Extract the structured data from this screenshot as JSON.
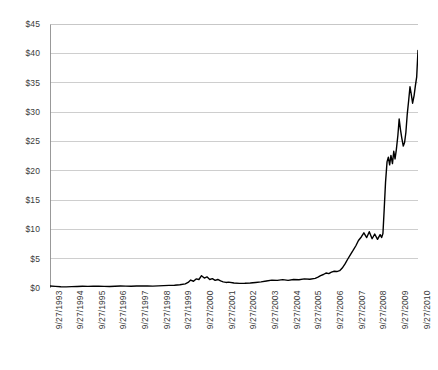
{
  "chart_data": {
    "type": "line",
    "title": "",
    "subtitle": "",
    "xlabel": "",
    "ylabel": "",
    "legend": [],
    "legend_position": "none",
    "grid": {
      "horizontal": true,
      "vertical": false,
      "color": "#b9b9b9"
    },
    "series_color": "#000000",
    "line_width": 1.4,
    "ylim": [
      0,
      45
    ],
    "ytick_step": 5,
    "ytick_labels": [
      "$0",
      "$5",
      "$10",
      "$15",
      "$20",
      "$25",
      "$30",
      "$35",
      "$40",
      "$45"
    ],
    "ytick_values": [
      0,
      5,
      10,
      15,
      20,
      25,
      30,
      35,
      40,
      45
    ],
    "xtick_labels": [
      "9/27/1993",
      "9/27/1994",
      "9/27/1995",
      "9/27/1996",
      "9/27/1997",
      "9/27/1998",
      "9/27/1999",
      "9/27/2000",
      "9/27/2001",
      "9/27/2002",
      "9/27/2003",
      "9/27/2004",
      "9/27/2005",
      "9/27/2006",
      "9/27/2007",
      "9/27/2008",
      "9/27/2009",
      "9/27/2010"
    ],
    "xlim": [
      1993.74,
      2010.74
    ],
    "series": [
      {
        "name": "price",
        "x": [
          1993.74,
          1993.99,
          1994.24,
          1994.49,
          1994.74,
          1994.99,
          1995.24,
          1995.49,
          1995.74,
          1995.99,
          1996.24,
          1996.49,
          1996.74,
          1996.99,
          1997.24,
          1997.49,
          1997.74,
          1997.99,
          1998.24,
          1998.49,
          1998.74,
          1998.99,
          1999.24,
          1999.49,
          1999.74,
          1999.99,
          2000.12,
          2000.24,
          2000.37,
          2000.49,
          2000.62,
          2000.74,
          2000.87,
          2000.99,
          2001.12,
          2001.24,
          2001.37,
          2001.49,
          2001.62,
          2001.74,
          2001.87,
          2001.99,
          2002.24,
          2002.49,
          2002.74,
          2002.99,
          2003.24,
          2003.49,
          2003.74,
          2003.99,
          2004.24,
          2004.49,
          2004.74,
          2004.99,
          2005.24,
          2005.49,
          2005.74,
          2005.99,
          2006.12,
          2006.24,
          2006.37,
          2006.49,
          2006.62,
          2006.74,
          2006.87,
          2006.99,
          2007.12,
          2007.24,
          2007.37,
          2007.49,
          2007.62,
          2007.74,
          2007.87,
          2007.99,
          2008.12,
          2008.24,
          2008.37,
          2008.49,
          2008.62,
          2008.74,
          2008.87,
          2008.99,
          2009.06,
          2009.12,
          2009.18,
          2009.24,
          2009.31,
          2009.37,
          2009.43,
          2009.49,
          2009.56,
          2009.62,
          2009.68,
          2009.74,
          2009.81,
          2009.87,
          2009.93,
          2009.99,
          2010.06,
          2010.12,
          2010.18,
          2010.24,
          2010.31,
          2010.37,
          2010.43,
          2010.49,
          2010.56,
          2010.62,
          2010.68,
          2010.74
        ],
        "values": [
          0.35,
          0.28,
          0.22,
          0.2,
          0.24,
          0.26,
          0.3,
          0.28,
          0.32,
          0.3,
          0.28,
          0.26,
          0.3,
          0.34,
          0.32,
          0.3,
          0.34,
          0.36,
          0.34,
          0.32,
          0.36,
          0.4,
          0.44,
          0.48,
          0.55,
          0.7,
          0.95,
          1.35,
          1.15,
          1.55,
          1.45,
          2.1,
          1.7,
          1.9,
          1.45,
          1.6,
          1.3,
          1.45,
          1.2,
          1.05,
          0.95,
          1.0,
          0.85,
          0.78,
          0.8,
          0.85,
          0.95,
          1.05,
          1.2,
          1.35,
          1.3,
          1.42,
          1.3,
          1.45,
          1.4,
          1.55,
          1.5,
          1.65,
          1.85,
          2.1,
          2.3,
          2.55,
          2.45,
          2.7,
          2.85,
          2.8,
          2.95,
          3.4,
          4.1,
          4.9,
          5.7,
          6.4,
          7.2,
          8.1,
          8.7,
          9.4,
          8.6,
          9.6,
          8.4,
          9.2,
          8.3,
          9.1,
          8.6,
          9.3,
          13.5,
          18.0,
          21.5,
          22.3,
          21.0,
          22.6,
          21.2,
          23.3,
          22.0,
          23.6,
          26.0,
          28.8,
          27.0,
          25.6,
          24.2,
          24.8,
          26.5,
          29.5,
          32.0,
          34.3,
          33.0,
          31.5,
          32.8,
          34.5,
          36.0,
          40.5
        ]
      }
    ]
  }
}
